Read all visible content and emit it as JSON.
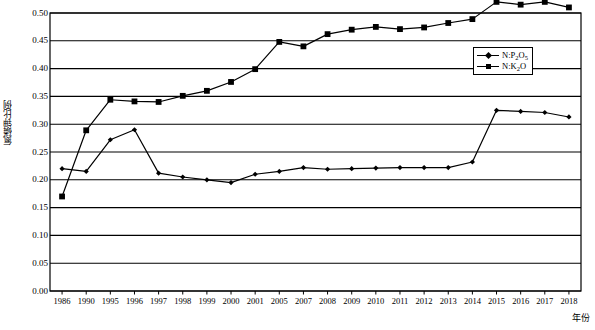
{
  "chart_data": {
    "type": "line",
    "title": "",
    "xlabel": "年份",
    "ylabel": "氮磷钾比例",
    "grid": true,
    "legend_position": "inside-right",
    "ylim": [
      0.0,
      0.5
    ],
    "yticks": [
      "0.50",
      "0.45",
      "0.40",
      "0.35",
      "0.30",
      "0.25",
      "0.20",
      "0.15",
      "0.10",
      "0.05",
      "0.00"
    ],
    "ytick_values": [
      0.5,
      0.45,
      0.4,
      0.35,
      0.3,
      0.25,
      0.2,
      0.15,
      0.1,
      0.05,
      0.0
    ],
    "categories": [
      "1986",
      "1990",
      "1995",
      "1996",
      "1997",
      "1998",
      "1999",
      "2000",
      "2001",
      "2005",
      "2007",
      "2008",
      "2009",
      "2010",
      "2011",
      "2012",
      "2013",
      "2014",
      "2015",
      "2016",
      "2017",
      "2018"
    ],
    "series": [
      {
        "name": "N:P2O5",
        "name_html": "N:P<sub>2</sub>O<sub>5</sub>",
        "marker": "diamond",
        "color": "#000000",
        "values": [
          0.22,
          0.215,
          0.272,
          0.29,
          0.212,
          0.205,
          0.2,
          0.195,
          0.21,
          0.215,
          0.222,
          0.219,
          0.22,
          0.221,
          0.222,
          0.222,
          0.222,
          0.232,
          0.325,
          0.323,
          0.321,
          0.313
        ]
      },
      {
        "name": "N:K2O",
        "name_html": "N:K<sub>2</sub>O",
        "marker": "square",
        "color": "#000000",
        "values": [
          0.17,
          0.289,
          0.344,
          0.341,
          0.34,
          0.351,
          0.36,
          0.376,
          0.399,
          0.448,
          0.44,
          0.462,
          0.47,
          0.475,
          0.471,
          0.474,
          0.482,
          0.489,
          0.52,
          0.515,
          0.52,
          0.51
        ]
      }
    ]
  },
  "legend": {
    "items": [
      {
        "label": "N:P2O5",
        "marker": "diamond"
      },
      {
        "label": "N:K2O",
        "marker": "square"
      }
    ]
  }
}
